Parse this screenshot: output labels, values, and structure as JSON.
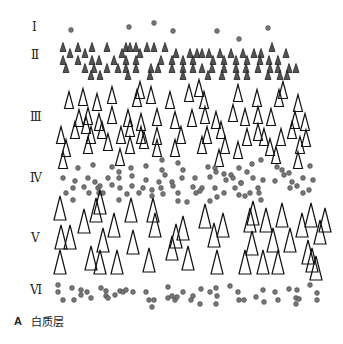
{
  "figure": {
    "colors": {
      "dot_fill": "#777777",
      "dot_stroke": "#444444",
      "small_tri_fill": "#555555",
      "small_tri_stroke": "#222222",
      "large_tri_stroke": "#111111",
      "background": "#ffffff"
    }
  },
  "layers": [
    {
      "label": "Ⅰ",
      "label_y": 27
    },
    {
      "label": "Ⅱ",
      "label_y": 55
    },
    {
      "label": "Ⅲ",
      "label_y": 117
    },
    {
      "label": "Ⅳ",
      "label_y": 178
    },
    {
      "label": "Ⅴ",
      "label_y": 238
    },
    {
      "label": "Ⅵ",
      "label_y": 290
    }
  ],
  "caption": {
    "letter": "A",
    "text": "白质层"
  },
  "shapes": {
    "layer1_dots": [
      [
        71,
        30
      ],
      [
        129,
        27
      ],
      [
        154,
        23
      ],
      [
        173,
        31
      ],
      [
        217,
        31
      ],
      [
        239,
        39
      ],
      [
        268,
        28
      ]
    ],
    "layer2_small_triangles": [
      [
        63,
        47
      ],
      [
        70,
        53
      ],
      [
        78,
        47
      ],
      [
        85,
        53
      ],
      [
        92,
        47
      ],
      [
        107,
        47
      ],
      [
        122,
        53
      ],
      [
        126,
        47
      ],
      [
        130,
        47
      ],
      [
        136,
        47
      ],
      [
        147,
        47
      ],
      [
        154,
        47
      ],
      [
        165,
        47
      ],
      [
        176,
        53
      ],
      [
        190,
        53
      ],
      [
        197,
        53
      ],
      [
        209,
        53
      ],
      [
        220,
        53
      ],
      [
        231,
        53
      ],
      [
        243,
        53
      ],
      [
        254,
        53
      ],
      [
        261,
        53
      ],
      [
        272,
        47
      ],
      [
        286,
        53
      ],
      [
        63,
        60
      ],
      [
        78,
        60
      ],
      [
        92,
        60
      ],
      [
        99,
        60
      ],
      [
        114,
        60
      ],
      [
        126,
        60
      ],
      [
        136,
        60
      ],
      [
        140,
        53
      ],
      [
        161,
        60
      ],
      [
        172,
        60
      ],
      [
        183,
        60
      ],
      [
        193,
        60
      ],
      [
        202,
        53
      ],
      [
        213,
        60
      ],
      [
        224,
        60
      ],
      [
        236,
        60
      ],
      [
        247,
        60
      ],
      [
        260,
        60
      ],
      [
        269,
        60
      ],
      [
        278,
        60
      ],
      [
        66,
        68
      ],
      [
        85,
        68
      ],
      [
        94,
        68
      ],
      [
        107,
        68
      ],
      [
        118,
        68
      ],
      [
        126,
        68
      ],
      [
        136,
        68
      ],
      [
        151,
        68
      ],
      [
        158,
        68
      ],
      [
        172,
        68
      ],
      [
        183,
        68
      ],
      [
        193,
        68
      ],
      [
        202,
        68
      ],
      [
        212,
        68
      ],
      [
        224,
        68
      ],
      [
        236,
        68
      ],
      [
        246,
        68
      ],
      [
        258,
        68
      ],
      [
        270,
        68
      ],
      [
        278,
        68
      ],
      [
        289,
        68
      ],
      [
        296,
        68
      ],
      [
        91,
        75
      ],
      [
        100,
        75
      ],
      [
        128,
        75
      ],
      [
        150,
        75
      ],
      [
        183,
        75
      ],
      [
        208,
        75
      ],
      [
        222,
        75
      ],
      [
        237,
        75
      ],
      [
        247,
        75
      ],
      [
        268,
        75
      ],
      [
        280,
        75
      ],
      [
        287,
        75
      ]
    ],
    "layer3_large_triangles": [
      [
        69,
        100
      ],
      [
        83,
        97
      ],
      [
        97,
        102
      ],
      [
        112,
        95
      ],
      [
        137,
        98
      ],
      [
        140,
        90
      ],
      [
        151,
        95
      ],
      [
        170,
        100
      ],
      [
        189,
        93
      ],
      [
        199,
        88
      ],
      [
        204,
        100
      ],
      [
        238,
        93
      ],
      [
        257,
        98
      ],
      [
        279,
        98
      ],
      [
        283,
        90
      ],
      [
        298,
        103
      ],
      [
        79,
        118
      ],
      [
        88,
        116
      ],
      [
        99,
        122
      ],
      [
        112,
        115
      ],
      [
        128,
        118
      ],
      [
        141,
        122
      ],
      [
        157,
        117
      ],
      [
        175,
        120
      ],
      [
        192,
        118
      ],
      [
        205,
        115
      ],
      [
        216,
        120
      ],
      [
        233,
        113
      ],
      [
        245,
        117
      ],
      [
        258,
        115
      ],
      [
        271,
        117
      ],
      [
        295,
        120
      ],
      [
        305,
        122
      ],
      [
        61,
        135
      ],
      [
        75,
        130
      ],
      [
        86,
        125
      ],
      [
        102,
        130
      ],
      [
        121,
        135
      ],
      [
        130,
        128
      ],
      [
        141,
        135
      ],
      [
        157,
        136
      ],
      [
        181,
        135
      ],
      [
        207,
        135
      ],
      [
        221,
        130
      ],
      [
        247,
        137
      ],
      [
        258,
        132
      ],
      [
        281,
        137
      ],
      [
        292,
        130
      ],
      [
        306,
        138
      ],
      [
        66,
        148
      ],
      [
        88,
        145
      ],
      [
        91,
        135
      ],
      [
        108,
        142
      ],
      [
        130,
        145
      ],
      [
        144,
        140
      ],
      [
        157,
        148
      ],
      [
        175,
        148
      ],
      [
        202,
        145
      ],
      [
        225,
        145
      ],
      [
        238,
        150
      ],
      [
        264,
        137
      ],
      [
        270,
        147
      ],
      [
        276,
        155
      ],
      [
        300,
        145
      ],
      [
        63,
        160
      ],
      [
        120,
        157
      ],
      [
        219,
        158
      ],
      [
        298,
        160
      ]
    ],
    "layer4_dots": [
      [
        78,
        168
      ],
      [
        93,
        165
      ],
      [
        112,
        167
      ],
      [
        119,
        172
      ],
      [
        131,
        168
      ],
      [
        146,
        166
      ],
      [
        162,
        160
      ],
      [
        162,
        170
      ],
      [
        178,
        163
      ],
      [
        183,
        170
      ],
      [
        208,
        167
      ],
      [
        215,
        168
      ],
      [
        224,
        174
      ],
      [
        239,
        168
      ],
      [
        247,
        172
      ],
      [
        252,
        164
      ],
      [
        261,
        160
      ],
      [
        277,
        167
      ],
      [
        282,
        170
      ],
      [
        289,
        173
      ],
      [
        310,
        166
      ],
      [
        63,
        178
      ],
      [
        75,
        181
      ],
      [
        88,
        178
      ],
      [
        95,
        182
      ],
      [
        108,
        178
      ],
      [
        119,
        178
      ],
      [
        132,
        176
      ],
      [
        146,
        180
      ],
      [
        159,
        182
      ],
      [
        165,
        175
      ],
      [
        172,
        182
      ],
      [
        182,
        178
      ],
      [
        195,
        178
      ],
      [
        210,
        177
      ],
      [
        216,
        172
      ],
      [
        226,
        180
      ],
      [
        231,
        175
      ],
      [
        233,
        178
      ],
      [
        241,
        183
      ],
      [
        253,
        178
      ],
      [
        263,
        180
      ],
      [
        275,
        181
      ],
      [
        284,
        175
      ],
      [
        292,
        182
      ],
      [
        303,
        178
      ],
      [
        313,
        180
      ],
      [
        73,
        188
      ],
      [
        84,
        187
      ],
      [
        98,
        188
      ],
      [
        100,
        186
      ],
      [
        112,
        185
      ],
      [
        120,
        188
      ],
      [
        132,
        186
      ],
      [
        143,
        188
      ],
      [
        152,
        190
      ],
      [
        161,
        188
      ],
      [
        173,
        186
      ],
      [
        193,
        187
      ],
      [
        202,
        188
      ],
      [
        215,
        188
      ],
      [
        235,
        188
      ],
      [
        241,
        183
      ],
      [
        258,
        188
      ],
      [
        290,
        188
      ],
      [
        297,
        186
      ],
      [
        66,
        193
      ],
      [
        89,
        193
      ],
      [
        99,
        193
      ],
      [
        103,
        193
      ],
      [
        127,
        194
      ],
      [
        139,
        193
      ],
      [
        152,
        196
      ],
      [
        163,
        194
      ],
      [
        178,
        193
      ],
      [
        196,
        193
      ],
      [
        200,
        191
      ],
      [
        224,
        193
      ],
      [
        239,
        195
      ],
      [
        250,
        193
      ],
      [
        259,
        193
      ],
      [
        303,
        193
      ],
      [
        73,
        200
      ],
      [
        119,
        200
      ],
      [
        178,
        201
      ],
      [
        187,
        202
      ],
      [
        210,
        201
      ],
      [
        217,
        197
      ],
      [
        245,
        196
      ],
      [
        261,
        200
      ],
      [
        309,
        190
      ]
    ],
    "layer5_large_triangles": [
      [
        60,
        208
      ],
      [
        100,
        202
      ],
      [
        153,
        210
      ],
      [
        96,
        210
      ],
      [
        131,
        210
      ],
      [
        205,
        216
      ],
      [
        253,
        213
      ],
      [
        282,
        215
      ],
      [
        311,
        215
      ],
      [
        84,
        221
      ],
      [
        114,
        225
      ],
      [
        155,
        225
      ],
      [
        183,
        228
      ],
      [
        223,
        225
      ],
      [
        250,
        220
      ],
      [
        266,
        220
      ],
      [
        325,
        220
      ],
      [
        61,
        237
      ],
      [
        70,
        237
      ],
      [
        103,
        240
      ],
      [
        133,
        242
      ],
      [
        176,
        236
      ],
      [
        214,
        235
      ],
      [
        252,
        243
      ],
      [
        273,
        240
      ],
      [
        290,
        240
      ],
      [
        302,
        225
      ],
      [
        320,
        232
      ],
      [
        60,
        262
      ],
      [
        91,
        258
      ],
      [
        100,
        262
      ],
      [
        117,
        262
      ],
      [
        149,
        260
      ],
      [
        172,
        248
      ],
      [
        188,
        258
      ],
      [
        217,
        262
      ],
      [
        245,
        262
      ],
      [
        263,
        262
      ],
      [
        278,
        262
      ],
      [
        312,
        260
      ],
      [
        308,
        252
      ],
      [
        316,
        268
      ]
    ],
    "layer6_dots": [
      [
        58,
        292
      ],
      [
        63,
        300
      ],
      [
        72,
        288
      ],
      [
        74,
        300
      ],
      [
        81,
        295
      ],
      [
        81,
        290
      ],
      [
        87,
        292
      ],
      [
        91,
        298
      ],
      [
        101,
        288
      ],
      [
        106,
        291
      ],
      [
        106,
        296
      ],
      [
        108,
        298
      ],
      [
        115,
        295
      ],
      [
        120,
        291
      ],
      [
        123,
        292
      ],
      [
        126,
        290
      ],
      [
        133,
        292
      ],
      [
        146,
        292
      ],
      [
        149,
        300
      ],
      [
        154,
        300
      ],
      [
        152,
        307
      ],
      [
        168,
        287
      ],
      [
        168,
        298
      ],
      [
        172,
        296
      ],
      [
        175,
        300
      ],
      [
        177,
        297
      ],
      [
        183,
        292
      ],
      [
        191,
        300
      ],
      [
        193,
        296
      ],
      [
        200,
        304
      ],
      [
        201,
        289
      ],
      [
        210,
        292
      ],
      [
        216,
        288
      ],
      [
        216,
        304
      ],
      [
        217,
        296
      ],
      [
        230,
        286
      ],
      [
        238,
        292
      ],
      [
        239,
        300
      ],
      [
        244,
        300
      ],
      [
        256,
        297
      ],
      [
        264,
        302
      ],
      [
        263,
        290
      ],
      [
        275,
        292
      ],
      [
        278,
        300
      ],
      [
        289,
        289
      ],
      [
        296,
        298
      ],
      [
        297,
        290
      ],
      [
        299,
        299
      ],
      [
        296,
        304
      ],
      [
        310,
        285
      ],
      [
        317,
        293
      ],
      [
        317,
        300
      ],
      [
        58,
        285
      ]
    ]
  }
}
